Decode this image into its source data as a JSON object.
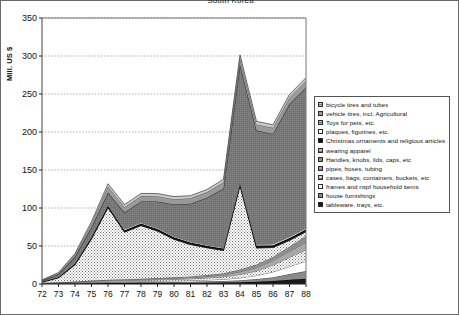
{
  "title": "South Korea",
  "axes": {
    "ylabel": "MIll. US $",
    "yticks": [
      "0",
      "50",
      "100",
      "150",
      "200",
      "250",
      "300",
      "350"
    ],
    "xticks": [
      "72",
      "73",
      "74",
      "75",
      "76",
      "77",
      "78",
      "79",
      "80",
      "81",
      "82",
      "83",
      "84",
      "85",
      "86",
      "87",
      "88"
    ]
  },
  "legend": {
    "items": [
      {
        "label": "bicycle tires and tubes",
        "fill": "#c9c9c9"
      },
      {
        "label": "vehicle tires, incl. Agricultural",
        "fill": "#9a9a9a"
      },
      {
        "label": "Toys for pets, etc.",
        "fill": "#b4b4b4"
      },
      {
        "label": "plaques, figurines, etc.",
        "fill": "#ffffff"
      },
      {
        "label": "Christmas ornaments and religious articles",
        "fill": "#111111"
      },
      {
        "label": "wearing apparel",
        "fill": "#bdbdbd"
      },
      {
        "label": "Handles, knobs, lids, caps, etc",
        "fill": "#8e8e8e"
      },
      {
        "label": "pipes, hoses, tubing",
        "fill": "#a8a8a8"
      },
      {
        "label": "cases, bags, containers, buckets, etc",
        "fill": "#d2d2d2"
      },
      {
        "label": "frames and nspf household items",
        "fill": "#ffffff"
      },
      {
        "label": "house furnishings",
        "fill": "#8a8a8a"
      },
      {
        "label": "tableware, trays, etc.",
        "fill": "#1a1a1a"
      }
    ]
  },
  "chart_data": {
    "type": "area",
    "title": "South Korea",
    "xlabel": "",
    "ylabel": "MIll. US $",
    "ylim": [
      0,
      350
    ],
    "grid": true,
    "legend_position": "right",
    "stacked": true,
    "categories": [
      "72",
      "73",
      "74",
      "75",
      "76",
      "77",
      "78",
      "79",
      "80",
      "81",
      "82",
      "83",
      "84",
      "85",
      "86",
      "87",
      "88"
    ],
    "series": [
      {
        "name": "tableware, trays, etc.",
        "values": [
          0.4,
          0.6,
          0.8,
          1.0,
          1.2,
          1.2,
          1.3,
          1.4,
          1.5,
          1.6,
          1.8,
          2.0,
          2.4,
          3.0,
          4.0,
          5.5,
          7.0
        ]
      },
      {
        "name": "house furnishings",
        "values": [
          0.3,
          0.5,
          0.7,
          0.9,
          1.0,
          1.1,
          1.2,
          1.3,
          1.4,
          1.5,
          1.7,
          2.0,
          2.6,
          3.5,
          5.0,
          7.5,
          10.0
        ]
      },
      {
        "name": "frames and nspf household items",
        "values": [
          0.2,
          0.3,
          0.5,
          0.7,
          0.8,
          0.9,
          1.0,
          1.1,
          1.3,
          1.5,
          1.8,
          2.2,
          3.0,
          4.5,
          7.0,
          10.0,
          13.0
        ]
      },
      {
        "name": "cases, bags, containers, buckets, etc",
        "values": [
          0.2,
          0.3,
          0.5,
          0.8,
          1.0,
          1.2,
          1.4,
          1.6,
          1.9,
          2.2,
          2.6,
          3.2,
          4.5,
          6.0,
          9.0,
          12.0,
          15.0
        ]
      },
      {
        "name": "pipes, hoses, tubing",
        "values": [
          0.2,
          0.3,
          0.5,
          0.7,
          0.9,
          1.0,
          1.1,
          1.3,
          1.5,
          1.7,
          2.0,
          2.5,
          3.5,
          4.5,
          6.0,
          8.0,
          10.0
        ]
      },
      {
        "name": "Handles, knobs, lids, caps, etc",
        "values": [
          0.2,
          0.3,
          0.4,
          0.6,
          0.8,
          0.9,
          1.0,
          1.1,
          1.3,
          1.5,
          1.8,
          2.2,
          3.0,
          4.0,
          5.0,
          6.5,
          8.0
        ]
      },
      {
        "name": "wearing apparel",
        "values": [
          1.0,
          6.0,
          22.0,
          55.0,
          95.0,
          62.0,
          70.0,
          62.0,
          50.0,
          42.0,
          36.0,
          30.0,
          110.0,
          22.0,
          12.0,
          8.0,
          6.0
        ]
      },
      {
        "name": "Christmas ornaments and religious articles",
        "values": [
          0.5,
          1.0,
          1.5,
          2.0,
          2.5,
          2.5,
          2.5,
          2.5,
          2.5,
          2.5,
          2.5,
          2.5,
          3.0,
          3.0,
          3.0,
          3.0,
          3.0
        ]
      },
      {
        "name": "plaques, figurines, etc.",
        "values": [
          0.3,
          0.5,
          0.8,
          1.0,
          1.2,
          1.2,
          1.2,
          1.2,
          1.2,
          1.2,
          1.2,
          1.2,
          1.5,
          1.5,
          1.5,
          1.5,
          1.5
        ]
      },
      {
        "name": "Toys for pets, etc.",
        "values": [
          1.0,
          3.0,
          8.0,
          12.0,
          16.0,
          22.0,
          28.0,
          35.0,
          42.0,
          50.0,
          62.0,
          78.0,
          155.0,
          150.0,
          145.0,
          175.0,
          185.0
        ]
      },
      {
        "name": "vehicle tires, incl. Agricultural",
        "values": [
          0.6,
          1.5,
          3.0,
          5.0,
          8.0,
          7.0,
          7.0,
          7.0,
          7.0,
          7.0,
          7.5,
          8.0,
          9.0,
          8.0,
          8.0,
          8.5,
          9.0
        ]
      },
      {
        "name": "bicycle tires and tubes",
        "values": [
          0.4,
          0.8,
          1.5,
          2.5,
          3.5,
          3.5,
          3.5,
          3.5,
          3.5,
          3.5,
          3.5,
          4.0,
          4.0,
          4.0,
          4.0,
          4.0,
          4.0
        ]
      }
    ],
    "totals": [
      5.3,
      15.1,
      41.2,
      82.2,
      131.9,
      104.5,
      118.2,
      118.0,
      115.1,
      115.2,
      124.4,
      137.8,
      301.5,
      214.0,
      209.5,
      249.5,
      271.5
    ]
  }
}
